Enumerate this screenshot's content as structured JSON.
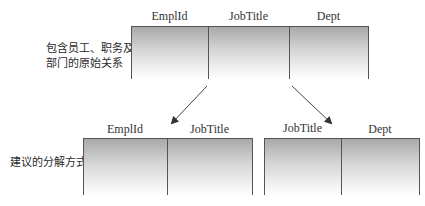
{
  "original": {
    "label": "包含员工、职务及\n部门的原始关系",
    "label_line1": "包含员工、职务及",
    "label_line2": "部门的原始关系",
    "columns": [
      "EmplId",
      "JobTitle",
      "Dept"
    ]
  },
  "decomposition": {
    "label": "建议的分解方式",
    "tables": [
      {
        "columns": [
          "EmplId",
          "JobTitle"
        ]
      },
      {
        "columns": [
          "JobTitle",
          "Dept"
        ]
      }
    ]
  },
  "colors": {
    "border": "#555555",
    "gradient_top": "#a9a9a9",
    "gradient_bottom": "#ffffff"
  }
}
